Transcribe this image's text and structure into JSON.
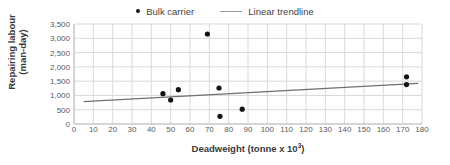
{
  "chart_data": {
    "type": "scatter",
    "title": "",
    "xlabel": "Deadweight (tonne x 10³)",
    "ylabel_line1": "Repairing labour",
    "ylabel_line2": "(man-day)",
    "xlim": [
      0,
      180
    ],
    "ylim": [
      0,
      3500
    ],
    "xticks": [
      0,
      10,
      20,
      30,
      40,
      50,
      60,
      70,
      80,
      90,
      100,
      110,
      120,
      130,
      140,
      150,
      160,
      170,
      180
    ],
    "xtick_labels": [
      "0",
      "10",
      "20",
      "30",
      "40",
      "50",
      "60",
      "70",
      "80",
      "90",
      "100",
      "110",
      "120",
      "130",
      "140",
      "150",
      "160",
      "170",
      "180"
    ],
    "yticks": [
      0,
      500,
      1000,
      1500,
      2000,
      2500,
      3000,
      3500
    ],
    "ytick_labels": [
      "0",
      "500",
      "1,000",
      "1,500",
      "2,000",
      "2,500",
      "3,000",
      "3,500"
    ],
    "grid": true,
    "legend_position": "top-center",
    "series": [
      {
        "name": "Bulk carrier",
        "type": "scatter",
        "marker": "circle",
        "color": "#141414",
        "points": [
          {
            "x": 46,
            "y": 1060
          },
          {
            "x": 50,
            "y": 840
          },
          {
            "x": 54,
            "y": 1200
          },
          {
            "x": 69,
            "y": 3150
          },
          {
            "x": 75,
            "y": 1260
          },
          {
            "x": 75.5,
            "y": 270
          },
          {
            "x": 87,
            "y": 520
          },
          {
            "x": 172,
            "y": 1650
          },
          {
            "x": 172,
            "y": 1380
          }
        ]
      },
      {
        "name": "Linear trendline",
        "type": "line",
        "color": "#6f6f6f",
        "endpoints": [
          {
            "x": 5,
            "y": 780
          },
          {
            "x": 178,
            "y": 1420
          }
        ]
      }
    ]
  },
  "legend": {
    "items": [
      {
        "label": "Bulk carrier",
        "marker": "dot-marker",
        "color": "#141414"
      },
      {
        "label": "Linear trendline",
        "marker": "line-marker",
        "color": "#9a9a9a"
      }
    ]
  },
  "colors": {
    "marker": "#141414",
    "trendline": "#6f6f6f",
    "gridline": "#d9d9d9",
    "axis_text": "#5a5a5a",
    "title_text": "#3a3a3a",
    "background": "#ffffff"
  }
}
